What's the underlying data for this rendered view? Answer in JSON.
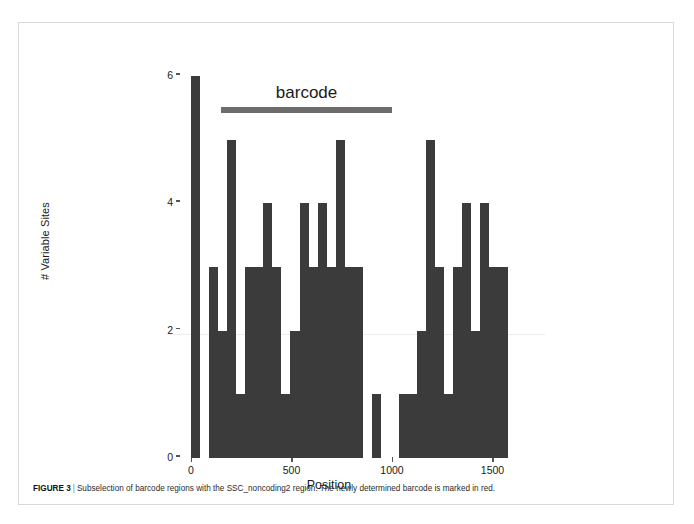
{
  "figure": {
    "label": "FIGURE 3",
    "separator": "|",
    "caption": "Subselection of barcode regions with the SSC_noncoding2 region. The newly determined barcode is marked in red."
  },
  "annotation": {
    "barcode_label": "barcode",
    "barcode_start": 150,
    "barcode_end": 1000,
    "color": "#6c6c6c"
  },
  "chart_data": {
    "type": "bar",
    "title": "",
    "xlabel": "Position",
    "ylabel": "# Variable Sites",
    "xlim": [
      -40,
      1780
    ],
    "ylim": [
      0,
      6
    ],
    "xticks": [
      0,
      500,
      1000,
      1500
    ],
    "xtick_labels": [
      "0",
      "500",
      "1000",
      "1500"
    ],
    "yticks": [
      0,
      2,
      4,
      6
    ],
    "ytick_labels": [
      "0",
      "2",
      "4",
      "6"
    ],
    "grid": false,
    "legend": "none",
    "bar_color": "#3b3b3b",
    "bin_width": 45,
    "x": [
      0,
      45,
      90,
      135,
      180,
      225,
      270,
      315,
      360,
      405,
      450,
      495,
      540,
      585,
      630,
      675,
      720,
      765,
      810,
      855,
      900,
      945,
      990,
      1035,
      1080,
      1125,
      1170,
      1215,
      1260,
      1305,
      1350,
      1395,
      1440,
      1485,
      1530,
      1575,
      1620,
      1665,
      1710
    ],
    "values": [
      6,
      0,
      3,
      2,
      5,
      1,
      3,
      3,
      4,
      3,
      1,
      2,
      4,
      3,
      4,
      3,
      5,
      3,
      3,
      0,
      1,
      0,
      0,
      1,
      1,
      2,
      5,
      3,
      1,
      3,
      4,
      2,
      4,
      3,
      3,
      0,
      0,
      0,
      0
    ]
  }
}
